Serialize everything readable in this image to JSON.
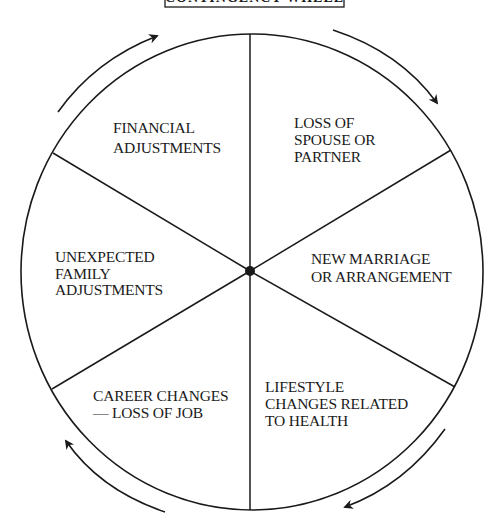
{
  "diagram": {
    "title": "CONTINGENCY WHEEL",
    "colors": {
      "ink": "#1a1a1a",
      "background": "#ffffff"
    },
    "segments": [
      {
        "id": "financial",
        "lines": [
          "FINANCIAL",
          "ADJUSTMENTS"
        ]
      },
      {
        "id": "loss-of-spouse",
        "lines": [
          "LOSS OF",
          "SPOUSE OR",
          "PARTNER"
        ]
      },
      {
        "id": "new-marriage",
        "lines": [
          "NEW MARRIAGE",
          "OR ARRANGEMENT"
        ]
      },
      {
        "id": "lifestyle-health",
        "lines": [
          "LIFESTYLE",
          "CHANGES RELATED",
          "TO HEALTH"
        ]
      },
      {
        "id": "career-changes",
        "lines": [
          "CAREER CHANGES",
          "— LOSS OF JOB"
        ]
      },
      {
        "id": "unexpected-family",
        "lines": [
          "UNEXPECTED",
          "FAMILY",
          "ADJUSTMENTS"
        ]
      }
    ],
    "flow_direction": "clockwise",
    "arrow_count": 4
  }
}
